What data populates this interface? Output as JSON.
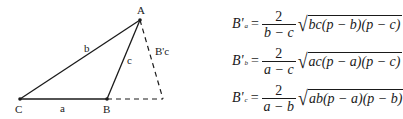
{
  "diagram": {
    "vertices": {
      "A": {
        "label": "A",
        "x": 140,
        "y": 20
      },
      "B": {
        "label": "B",
        "x": 107,
        "y": 99
      },
      "C": {
        "label": "C",
        "x": 20,
        "y": 99
      },
      "foot": {
        "x": 163,
        "y": 99
      }
    },
    "side_labels": {
      "a": "a",
      "b": "b",
      "c": "c",
      "altitude": "B'c"
    },
    "line_color": "#1a1a1a"
  },
  "formulas": [
    {
      "lhs": "B'",
      "sub": "a",
      "num": "2",
      "den": "b − c",
      "radicand": "bc(p − b)(p − c)"
    },
    {
      "lhs": "B'",
      "sub": "b",
      "num": "2",
      "den": "a − c",
      "radicand": "ac(p − a)(p − c)"
    },
    {
      "lhs": "B'",
      "sub": "c",
      "num": "2",
      "den": "a − b",
      "radicand": "ab(p − a)(p − b)"
    }
  ],
  "symbols": {
    "equals": "=",
    "radical": "√"
  }
}
